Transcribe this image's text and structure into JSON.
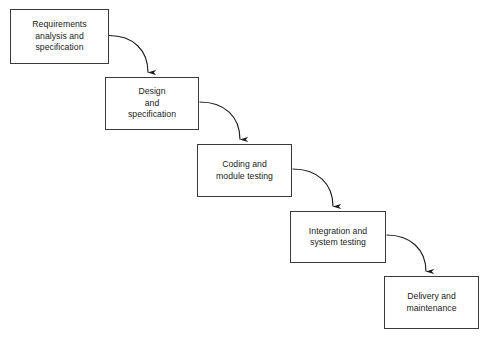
{
  "diagram": {
    "type": "flow-diagram",
    "background_color": "#ffffff",
    "box_border_color": "#3a3a3a",
    "box_fill_color": "#ffffff",
    "arrow_color": "#1c1c1c",
    "text_color": "#1c1c1c",
    "stages": [
      {
        "id": "requirements",
        "lines": [
          "Requirements",
          "analysis and",
          "specification"
        ],
        "x": 10,
        "y": 9,
        "width": 99,
        "height": 55
      },
      {
        "id": "design",
        "lines": [
          "Design",
          "and",
          "specification"
        ],
        "x": 105,
        "y": 77,
        "width": 94,
        "height": 53
      },
      {
        "id": "coding",
        "lines": [
          "Coding and",
          "module testing"
        ],
        "x": 197,
        "y": 144,
        "width": 95,
        "height": 53
      },
      {
        "id": "integration",
        "lines": [
          "Integration and",
          "system testing"
        ],
        "x": 290,
        "y": 211,
        "width": 96,
        "height": 52
      },
      {
        "id": "delivery",
        "lines": [
          "Delivery and",
          "maintenance"
        ],
        "x": 384,
        "y": 276,
        "width": 95,
        "height": 53
      }
    ],
    "connectors": [
      {
        "id": "requirements-to-design",
        "from": "requirements",
        "to": "design",
        "path": "M 109 35.5 C 133 35.5 148 50 148 73",
        "arrowhead_at": [
          148,
          77
        ]
      },
      {
        "id": "design-to-coding",
        "from": "design",
        "to": "coding",
        "path": "M 199.5 102 C 224 102 240 117 240 140",
        "arrowhead_at": [
          240,
          144
        ]
      },
      {
        "id": "coding-to-integration",
        "from": "coding",
        "to": "integration",
        "path": "M 292.5 169 C 317 169 333 184 333 207",
        "arrowhead_at": [
          333,
          211
        ]
      },
      {
        "id": "integration-to-delivery",
        "from": "integration",
        "to": "delivery",
        "path": "M 386.5 235 C 410 235 426 250 426 272",
        "arrowhead_at": [
          426,
          276
        ]
      }
    ]
  }
}
